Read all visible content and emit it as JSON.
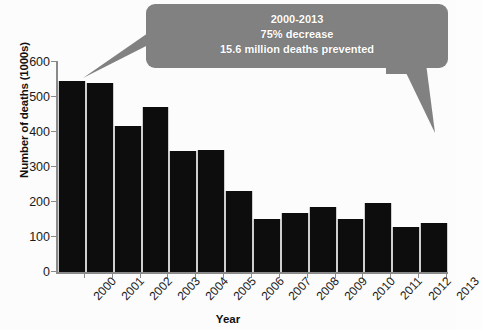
{
  "chart_data": {
    "type": "bar",
    "title": "",
    "xlabel": "Year",
    "ylabel": "Number of deaths (1000s)",
    "categories": [
      "2000",
      "2001",
      "2002",
      "2003",
      "2004",
      "2005",
      "2006",
      "2007",
      "2008",
      "2009",
      "2010",
      "2011",
      "2012",
      "2013"
    ],
    "values": [
      546,
      540,
      417,
      471,
      346,
      349,
      231,
      151,
      169,
      186,
      151,
      197,
      129,
      140
    ],
    "series": [
      {
        "name": "Number of deaths (1000s)",
        "values": [
          546,
          540,
          417,
          471,
          346,
          349,
          231,
          151,
          169,
          186,
          151,
          197,
          129,
          140
        ]
      }
    ],
    "ylim": [
      0,
      600
    ],
    "yticks": [
      0,
      100,
      200,
      300,
      400,
      500,
      600
    ],
    "ytick_labels": [
      "0",
      "100",
      "200",
      "300",
      "400",
      "500",
      "600"
    ],
    "grid": false,
    "legend": "none",
    "bar_color": "#0d0d0d",
    "annotations": [
      {
        "name": "callout-bubble",
        "lines": [
          "2000-2013",
          "75% decrease",
          "15.6 million deaths prevented"
        ],
        "fill_color": "#808080",
        "text_color": "#ffffff",
        "points_to": [
          "2000",
          "2013"
        ]
      }
    ]
  },
  "axes": {
    "y_title": "Number of deaths (1000s)",
    "x_title": "Year",
    "y_tick_labels": [
      "600",
      "500",
      "400",
      "300",
      "200",
      "100",
      "0"
    ],
    "x_tick_labels": [
      "2000",
      "2001",
      "2002",
      "2003",
      "2004",
      "2005",
      "2006",
      "2007",
      "2008",
      "2009",
      "2010",
      "2011",
      "2012",
      "2013"
    ]
  },
  "callout": {
    "line1": "2000-2013",
    "line2": "75% decrease",
    "line3": "15.6 million deaths prevented"
  }
}
